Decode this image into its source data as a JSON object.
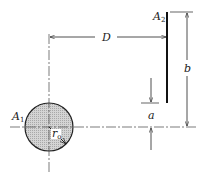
{
  "diagram": {
    "labels": {
      "A1": {
        "main": "A",
        "sub": "1"
      },
      "A2": {
        "main": "A",
        "sub": "2"
      },
      "D": "D",
      "b": "b",
      "a": "a",
      "r": {
        "main": "r",
        "sub": "o"
      }
    },
    "colors": {
      "line": "#222222",
      "disk_fill": "#c8c8c8"
    }
  }
}
